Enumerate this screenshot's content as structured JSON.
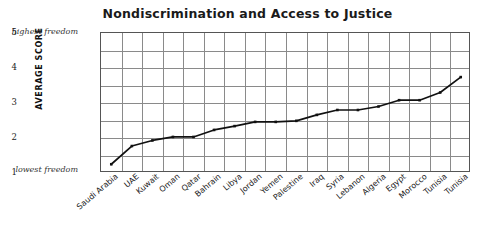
{
  "chart_data": {
    "type": "line",
    "title": "Nondiscrimination and Access to Justice",
    "xlabel": "",
    "ylabel": "AVERAGE SCORE",
    "ylim": [
      1,
      5
    ],
    "yticks": [
      "5",
      "4",
      "3",
      "2",
      "1"
    ],
    "grid": true,
    "legend": "none",
    "annotations": {
      "y_top_note": "highest freedom",
      "y_bottom_note": "lowest freedom"
    },
    "categories": [
      "Saudi Arabia",
      "UAE",
      "Kuwait",
      "Oman",
      "Qatar",
      "Bahrain",
      "Libya",
      "Jordan",
      "Yemen",
      "Palestine",
      "Iraq",
      "Syria",
      "Lebanon",
      "Algeria",
      "Egypt",
      "Morocco",
      "Tunisia"
    ],
    "values": [
      1.25,
      1.77,
      1.93,
      2.03,
      2.03,
      2.23,
      2.34,
      2.46,
      2.46,
      2.49,
      2.66,
      2.8,
      2.8,
      2.9,
      3.08,
      3.08,
      3.3
    ],
    "extra_point": {
      "label": "Tunisia",
      "value": 3.74
    },
    "colors": {
      "line": "#111111",
      "grid": "#8a8a8a",
      "frame": "#555555",
      "text": "#1a1a1a",
      "background": "#ffffff"
    }
  }
}
